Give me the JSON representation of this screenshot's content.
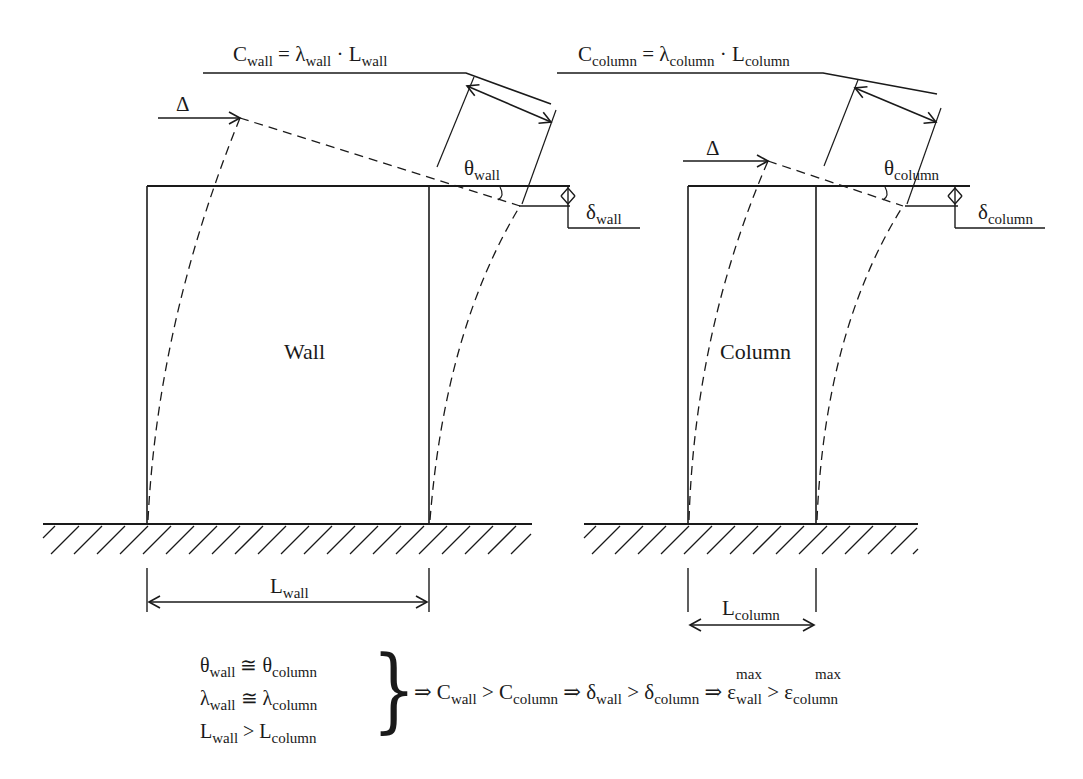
{
  "labels": {
    "wall_body": "Wall",
    "column_body": "Column",
    "delta": "Δ",
    "wall_capacity": {
      "C": "C",
      "sub": "wall",
      "eq": " = ",
      "lambda": "λ",
      "lambda_sub": "wall",
      "dot": " · ",
      "L": "L",
      "L_sub": "wall"
    },
    "column_capacity": {
      "C": "C",
      "sub": "column",
      "eq": " = ",
      "lambda": "λ",
      "lambda_sub": "column",
      "dot": " · ",
      "L": "L",
      "L_sub": "column"
    },
    "theta_wall": {
      "sym": "θ",
      "sub": "wall"
    },
    "theta_column": {
      "sym": "θ",
      "sub": "column"
    },
    "delta_wall": {
      "sym": "δ",
      "sub": "wall"
    },
    "delta_column": {
      "sym": "δ",
      "sub": "column"
    },
    "L_wall": {
      "sym": "L",
      "sub": "wall"
    },
    "L_column": {
      "sym": "L",
      "sub": "column"
    }
  },
  "conditions": [
    {
      "left": "θ",
      "left_sub": "wall",
      "op": " ≅ ",
      "right": "θ",
      "right_sub": "column"
    },
    {
      "left": "λ",
      "left_sub": "wall",
      "op": " ≅ ",
      "right": "λ",
      "right_sub": "column"
    },
    {
      "left": "L",
      "left_sub": "wall",
      "op": " > ",
      "right": "L",
      "right_sub": "column"
    }
  ],
  "brace": "}",
  "conclusion": {
    "implies": "⇒",
    "c1": {
      "a": "C",
      "a_sub": "wall",
      "op": " > ",
      "b": "C",
      "b_sub": "column"
    },
    "c2": {
      "a": "δ",
      "a_sub": "wall",
      "op": " > ",
      "b": "δ",
      "b_sub": "column"
    },
    "c3": {
      "a": "ε",
      "a_sub": "wall",
      "a_sup": "max",
      "op": " > ",
      "b": "ε",
      "b_sub": "column",
      "b_sup": "max"
    }
  },
  "colors": {
    "ink": "#1a1a1a",
    "background": "#ffffff"
  }
}
